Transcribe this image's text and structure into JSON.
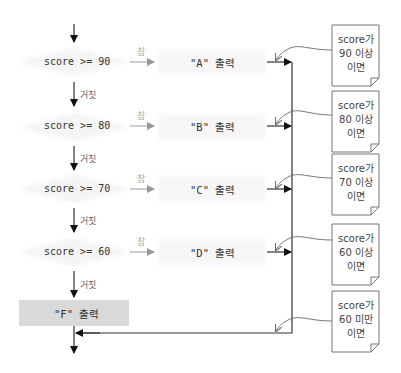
{
  "conditions": [
    {
      "text": "score >= 90",
      "output": "\"A\" 출력",
      "note": [
        "score가",
        "90 이상",
        "이면"
      ]
    },
    {
      "text": "score >= 80",
      "output": "\"B\" 출력",
      "note": [
        "score가",
        "80 이상",
        "이면"
      ]
    },
    {
      "text": "score >= 70",
      "output": "\"C\" 출력",
      "note": [
        "score가",
        "70 이상",
        "이면"
      ]
    },
    {
      "text": "score >= 60",
      "output": "\"D\" 출력",
      "note": [
        "score가",
        "60 이상",
        "이면"
      ]
    }
  ],
  "labels": {
    "true": "참",
    "false": "거짓"
  },
  "else_output": "\"F\" 출력",
  "else_note": [
    "score가",
    "60 미만",
    "이면"
  ],
  "colors": {
    "line": "#333333",
    "true_arrow": "#999999",
    "fbox": "#d9d9d9",
    "note_border": "#777777"
  }
}
